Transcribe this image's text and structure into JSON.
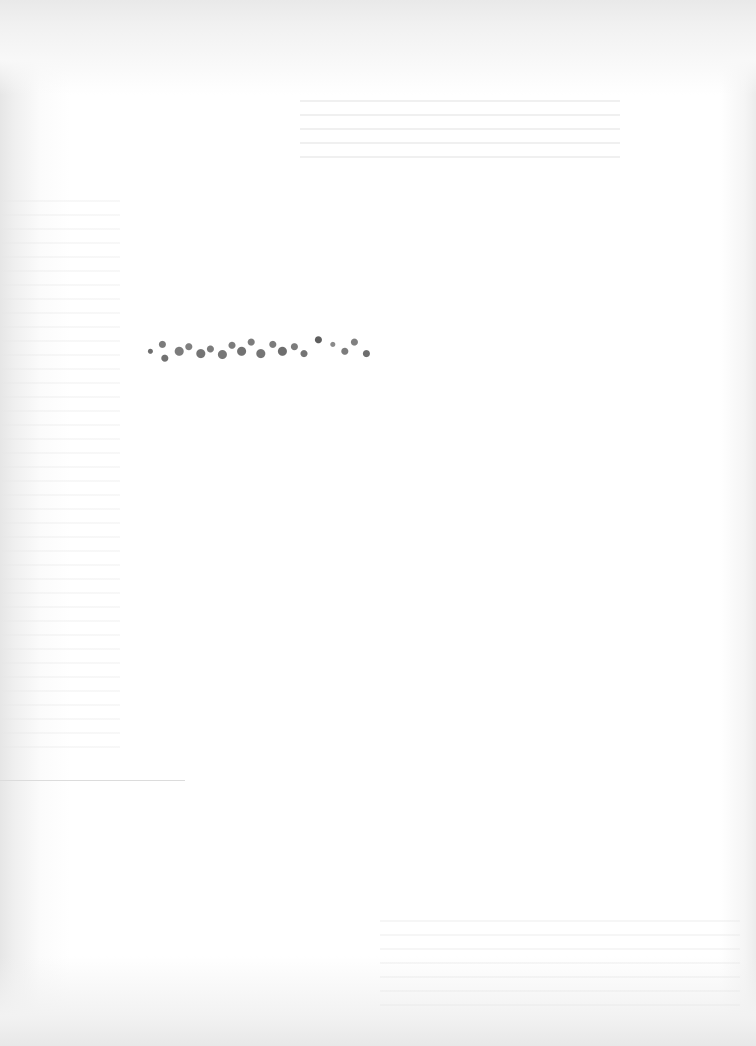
{
  "document": {
    "type": "scanned-page",
    "background_color": "#ffffff",
    "scan_edge_color": "#e8e8e8",
    "text_color": "#666666"
  },
  "content": {
    "degraded_line": {
      "text": "",
      "legible": false,
      "approx_glyph_count": 11
    }
  }
}
